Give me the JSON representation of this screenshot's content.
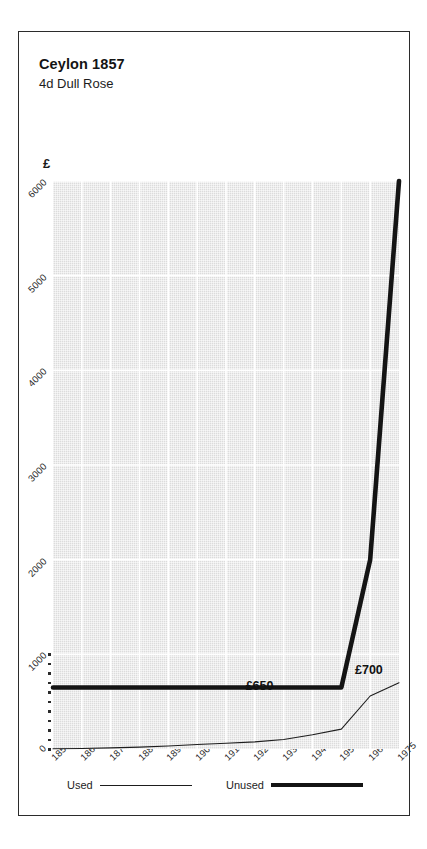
{
  "header": {
    "title": "Ceylon 1857",
    "subtitle": "4d Dull Rose"
  },
  "chart_data": {
    "type": "line",
    "title": "Ceylon 1857",
    "subtitle": "4d Dull Rose",
    "currency_symbol": "£",
    "xlabel": "",
    "ylabel": "£",
    "grid": true,
    "legend_position": "bottom",
    "xlim": [
      1857,
      1975
    ],
    "ylim": [
      0,
      6000
    ],
    "categories": [
      "1857",
      "1865",
      "1875",
      "1885",
      "1895",
      "1905",
      "1915",
      "1925",
      "1935",
      "1945",
      "1955",
      "1965",
      "1975"
    ],
    "ytick_labels": [
      "1000",
      "2000",
      "3000",
      "4000",
      "5000",
      "6000"
    ],
    "ytick_values": [
      1000,
      2000,
      3000,
      4000,
      5000,
      6000
    ],
    "y_origin_label": "0",
    "series": [
      {
        "name": "Used",
        "style": "thin",
        "values": [
          2,
          6,
          12,
          20,
          32,
          48,
          60,
          75,
          100,
          150,
          210,
          560,
          700
        ]
      },
      {
        "name": "Unused",
        "style": "thick",
        "values": [
          650,
          650,
          650,
          650,
          650,
          650,
          650,
          650,
          650,
          650,
          650,
          2000,
          6000
        ]
      }
    ],
    "annotations": [
      {
        "text": "£650",
        "series": "Unused",
        "value": 650,
        "at": "1935"
      },
      {
        "text": "£700",
        "series": "Used",
        "value": 700,
        "at": "1975"
      }
    ]
  },
  "legend": {
    "used_label": "Used",
    "unused_label": "Unused"
  },
  "colors": {
    "plot_background": "#dcdcdc",
    "gridline": "#ffffff",
    "line": "#141414",
    "frame": "#2b2b2b",
    "text": "#1a1a1a"
  }
}
